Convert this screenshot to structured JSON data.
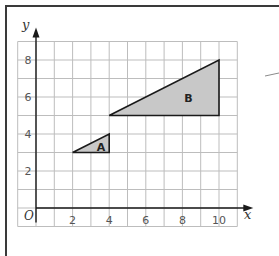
{
  "diagram": {
    "type": "coordinate-grid-enlargement",
    "axes": {
      "x_label": "x",
      "y_label": "y",
      "origin_label": "O",
      "x_ticks": [
        "2",
        "4",
        "6",
        "8",
        "10"
      ],
      "y_ticks": [
        "2",
        "4",
        "6",
        "8"
      ],
      "x_range": [
        -1,
        11
      ],
      "y_range": [
        -1,
        9
      ]
    },
    "shapes": [
      {
        "label": "A",
        "vertices": [
          [
            2,
            3
          ],
          [
            4,
            4
          ],
          [
            4,
            3
          ]
        ],
        "fill": "#c8c8c8"
      },
      {
        "label": "B",
        "vertices": [
          [
            4,
            5
          ],
          [
            10,
            8
          ],
          [
            10,
            5
          ]
        ],
        "fill": "#c8c8c8"
      }
    ],
    "colors": {
      "grid": "#bdbdbd",
      "axis": "#1a1a1a",
      "frame": "#3a3a3a",
      "shape_fill": "#c8c8c8",
      "shape_stroke": "#1a1a1a"
    }
  }
}
